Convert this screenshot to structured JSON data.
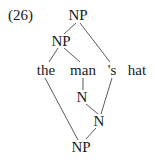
{
  "example_number": "(26)",
  "nodes": {
    "np_top": "NP",
    "np_inner": "NP",
    "word_the": "the",
    "word_man": "man",
    "word_s": "'s",
    "word_hat": "hat",
    "n_middle": "N",
    "n_lower": "N",
    "np_bottom": "NP"
  },
  "edges": [
    {
      "from": "np_top",
      "to": "np_inner"
    },
    {
      "from": "np_top",
      "to": "word_s"
    },
    {
      "from": "np_inner",
      "to": "word_the"
    },
    {
      "from": "np_inner",
      "to": "word_man"
    },
    {
      "from": "word_man",
      "to": "n_middle"
    },
    {
      "from": "n_middle",
      "to": "n_lower"
    },
    {
      "from": "word_s",
      "to": "n_lower"
    },
    {
      "from": "word_the",
      "to": "np_bottom"
    },
    {
      "from": "n_lower",
      "to": "np_bottom"
    }
  ],
  "colors": {
    "text": "#1a1a1a",
    "line": "#4a4a4a",
    "background": "#ffffff"
  }
}
